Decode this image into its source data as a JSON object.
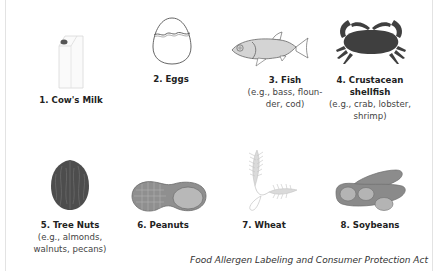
{
  "allergens": [
    {
      "name": "1. Cow's Milk",
      "examples": [],
      "icon": "milk-carton-icon"
    },
    {
      "name": "2. Eggs",
      "examples": [],
      "icon": "egg-icon"
    },
    {
      "name": "3. Fish",
      "examples": [
        "(e.g., bass, floun-",
        "der, cod)"
      ],
      "icon": "fish-icon"
    },
    {
      "name_lines": [
        "4. Crustacean",
        "shellfish"
      ],
      "examples": [
        "(e.g., crab, lobster,",
        "shrimp)"
      ],
      "icon": "crab-icon"
    },
    {
      "name": "5. Tree Nuts",
      "examples": [
        "(e.g., almonds,",
        "walnuts, pecans)"
      ],
      "icon": "walnut-icon"
    },
    {
      "name": "6. Peanuts",
      "examples": [],
      "icon": "peanut-icon"
    },
    {
      "name": "7. Wheat",
      "examples": [],
      "icon": "wheat-icon"
    },
    {
      "name": "8. Soybeans",
      "examples": [],
      "icon": "soybean-icon"
    }
  ],
  "footer": {
    "source": "Food Allergen Labeling and Consumer Protection Act"
  },
  "colors": {
    "icon_dark": "#4a4a4a",
    "icon_mid": "#8a8a8a",
    "icon_light": "#cfcfcf",
    "border": "#e3e3e3"
  }
}
